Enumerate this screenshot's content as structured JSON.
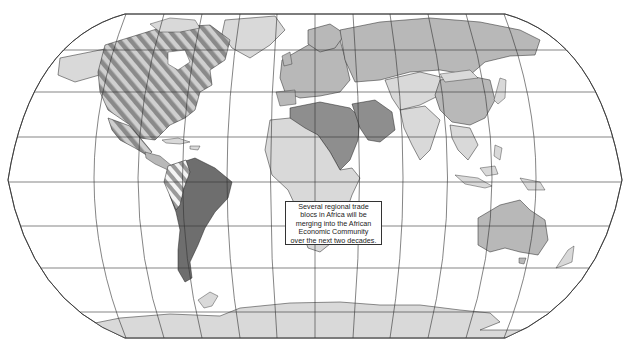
{
  "map": {
    "projection": "Robinson-like world projection",
    "graticule": {
      "parallels_y": [
        14,
        50,
        92,
        137,
        182,
        226,
        268,
        312
      ],
      "equator_y": 182,
      "color": "#333333"
    },
    "shading": {
      "ocean": "#ffffff",
      "light_land": "#d9d9d9",
      "medium_land": "#b8b8b8",
      "dark_land": "#8e8e8e",
      "darkest_land": "#6e6e6e",
      "hatch_dark": "#8a8a8a",
      "hatch_light": "#d0d0d0",
      "border": "#222222"
    },
    "regions": [
      {
        "name": "North America (NAFTA)",
        "fill": "hatched"
      },
      {
        "name": "Greenland",
        "fill": "light"
      },
      {
        "name": "Central America & Caribbean",
        "fill": "light"
      },
      {
        "name": "Andean countries",
        "fill": "hatched-light"
      },
      {
        "name": "South America (Mercosur)",
        "fill": "darkest"
      },
      {
        "name": "Europe (EU)",
        "fill": "medium"
      },
      {
        "name": "Russia & Central Asia",
        "fill": "medium"
      },
      {
        "name": "North Africa & Middle East",
        "fill": "dark"
      },
      {
        "name": "Sub-Saharan Africa",
        "fill": "light"
      },
      {
        "name": "South & East Asia",
        "fill": "light"
      },
      {
        "name": "China",
        "fill": "medium"
      },
      {
        "name": "Southeast Asia",
        "fill": "light"
      },
      {
        "name": "Australia",
        "fill": "medium"
      },
      {
        "name": "Antarctica",
        "fill": "light"
      }
    ]
  },
  "callout": {
    "lines": [
      "Several regional trade",
      "blocs in Africa will be",
      "merging into the African",
      "Economic Community",
      "over the next two decades."
    ]
  }
}
